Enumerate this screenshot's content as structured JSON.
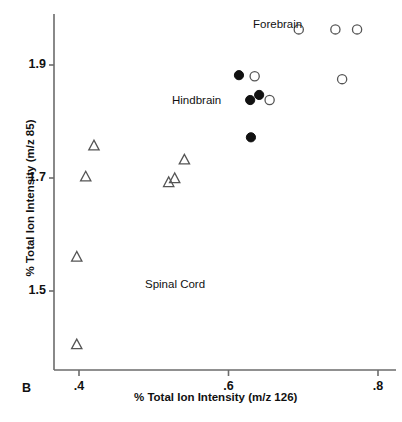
{
  "panel": {
    "letter": "B"
  },
  "chart_data": {
    "type": "scatter",
    "title": "",
    "xlabel": "% Total Ion Intensity (m/z 126)",
    "ylabel": "% Total Ion Intensity (m/z 85)",
    "xlim": [
      0.36,
      0.81
    ],
    "ylim": [
      1.37,
      1.99
    ],
    "xticks": [
      0.4,
      0.6,
      0.8
    ],
    "xtick_labels": [
      ".4",
      ".6",
      ".8"
    ],
    "yticks": [
      1.5,
      1.7,
      1.9
    ],
    "ytick_labels": [
      "1.5",
      "1.7",
      "1.9"
    ],
    "grid": false,
    "legend": "inline-annotations",
    "annotations": [
      {
        "text": "Forebrain",
        "x": 0.632,
        "y": 1.985
      },
      {
        "text": "Hindbrain",
        "x": 0.524,
        "y": 1.851
      },
      {
        "text": "Spinal Cord",
        "x": 0.488,
        "y": 1.527
      }
    ],
    "series": [
      {
        "name": "Forebrain",
        "marker": "open-circle",
        "color": "#555555",
        "fill": "none",
        "points": [
          {
            "x": 0.694,
            "y": 1.963
          },
          {
            "x": 0.743,
            "y": 1.963
          },
          {
            "x": 0.772,
            "y": 1.963
          },
          {
            "x": 0.752,
            "y": 1.875
          },
          {
            "x": 0.635,
            "y": 1.88
          },
          {
            "x": 0.655,
            "y": 1.838
          }
        ]
      },
      {
        "name": "Hindbrain",
        "marker": "filled-circle",
        "color": "#111111",
        "fill": "#111111",
        "points": [
          {
            "x": 0.614,
            "y": 1.882
          },
          {
            "x": 0.641,
            "y": 1.847
          },
          {
            "x": 0.629,
            "y": 1.838
          },
          {
            "x": 0.63,
            "y": 1.772
          }
        ]
      },
      {
        "name": "Spinal Cord",
        "marker": "open-triangle",
        "color": "#555555",
        "fill": "none",
        "points": [
          {
            "x": 0.42,
            "y": 1.757
          },
          {
            "x": 0.409,
            "y": 1.702
          },
          {
            "x": 0.541,
            "y": 1.732
          },
          {
            "x": 0.528,
            "y": 1.699
          },
          {
            "x": 0.52,
            "y": 1.692
          },
          {
            "x": 0.397,
            "y": 1.56
          },
          {
            "x": 0.397,
            "y": 1.405
          }
        ]
      }
    ]
  },
  "axis_geometry": {
    "plot_left": 54,
    "plot_right": 396,
    "plot_top": 14,
    "plot_bottom": 370,
    "x_ref_value": 0.4,
    "x_ref_px": 79,
    "x_px_per_unit": 747.5,
    "y_ref_value": 1.9,
    "y_ref_px": 65,
    "y_px_per_unit": 565.0
  }
}
